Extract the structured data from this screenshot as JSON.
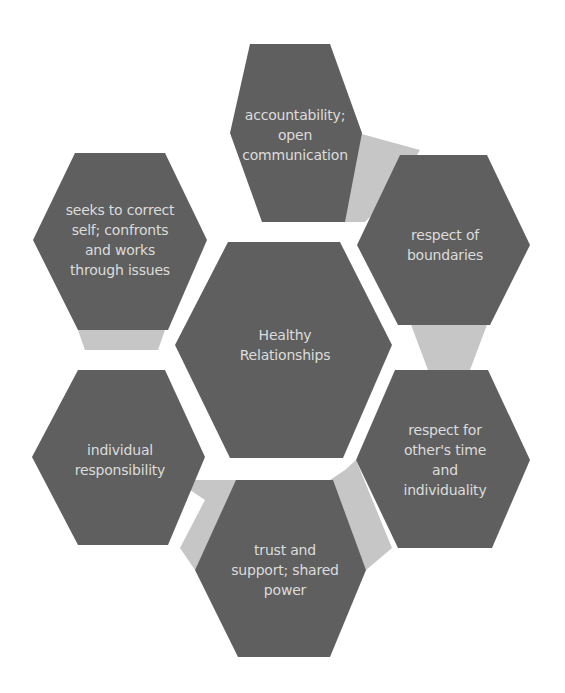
{
  "colors": {
    "hexagon_fill": "#5f5f5f",
    "connector_fill": "#c4c4c4",
    "text": "#dcdcdc",
    "background": "#ffffff"
  },
  "center": {
    "label": "Healthy Relationships",
    "lines": [
      "Healthy",
      "Relationships"
    ]
  },
  "nodes": [
    {
      "id": "top",
      "label": "accountability; open communication",
      "lines": [
        "accountability;",
        "open",
        "communication"
      ]
    },
    {
      "id": "top-right",
      "label": "respect of boundaries",
      "lines": [
        "respect of",
        "boundaries"
      ]
    },
    {
      "id": "bottom-right",
      "label": "respect for other's time and individuality",
      "lines": [
        "respect for",
        "other's time",
        "and",
        "individuality"
      ]
    },
    {
      "id": "bottom",
      "label": "trust and support; shared power",
      "lines": [
        "trust and",
        "support; shared",
        "power"
      ]
    },
    {
      "id": "bottom-left",
      "label": "individual responsibility",
      "lines": [
        "individual",
        "responsibility"
      ]
    },
    {
      "id": "top-left",
      "label": "seeks to correct self; confronts and works through issues",
      "lines": [
        "seeks to correct",
        "self; confronts",
        "and works",
        "through issues"
      ]
    }
  ]
}
